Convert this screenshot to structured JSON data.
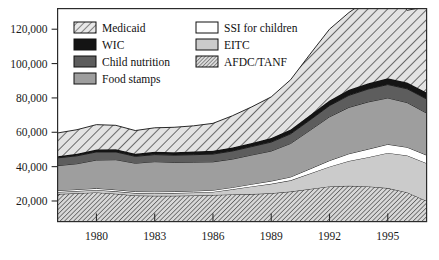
{
  "chart_data": {
    "type": "area",
    "title": "",
    "subtitle": "",
    "xlabel": "",
    "ylabel": "",
    "stacked": true,
    "grid": false,
    "legend_position": "top-left-inside",
    "x": [
      1978,
      1979,
      1980,
      1981,
      1982,
      1983,
      1984,
      1985,
      1986,
      1987,
      1988,
      1989,
      1990,
      1991,
      1992,
      1993,
      1994,
      1995,
      1996,
      1997
    ],
    "xlim": [
      1978,
      1997
    ],
    "ylim": [
      8000,
      132000
    ],
    "xticks": [
      1980,
      1983,
      1986,
      1989,
      1992,
      1995
    ],
    "xtick_labels": [
      "1980",
      "1983",
      "1986",
      "1989",
      "1992",
      "1995"
    ],
    "yticks": [
      20000,
      40000,
      60000,
      80000,
      100000,
      120000
    ],
    "ytick_labels": [
      "20,000",
      "40,000",
      "60,000",
      "80,000",
      "100,000",
      "120,000"
    ],
    "series": [
      {
        "name": "AFDC/TANF",
        "fill": "hatch-dense",
        "color": "#b7b7b7",
        "values": [
          24000,
          24500,
          25000,
          24200,
          23200,
          23000,
          23000,
          23200,
          23500,
          23800,
          24000,
          24500,
          25500,
          27000,
          28500,
          28800,
          28500,
          27500,
          25000,
          20000
        ]
      },
      {
        "name": "EITC",
        "fill": "solid",
        "color": "#cbcbcb",
        "values": [
          1200,
          1300,
          1400,
          1400,
          1400,
          1500,
          1600,
          1700,
          1800,
          3000,
          4500,
          5500,
          6500,
          9000,
          11500,
          14500,
          17000,
          20500,
          21500,
          22000
        ]
      },
      {
        "name": "SSI for children",
        "fill": "solid",
        "color": "#ffffff",
        "values": [
          900,
          900,
          950,
          950,
          900,
          900,
          900,
          950,
          1000,
          1100,
          1300,
          1600,
          2000,
          2700,
          3500,
          4200,
          4700,
          5000,
          4800,
          4700
        ]
      },
      {
        "name": "Food stamps",
        "fill": "solid",
        "color": "#9e9e9e",
        "values": [
          14500,
          15000,
          16500,
          17500,
          16500,
          17500,
          17000,
          16800,
          16500,
          16500,
          17000,
          17500,
          19500,
          22500,
          25500,
          27000,
          27500,
          27000,
          26000,
          24500
        ]
      },
      {
        "name": "Child nutrition",
        "fill": "solid",
        "color": "#5d5d5d",
        "values": [
          4500,
          4600,
          4700,
          4500,
          4000,
          4100,
          4200,
          4300,
          4500,
          4700,
          4900,
          5200,
          5600,
          6000,
          6500,
          7000,
          7500,
          7800,
          8000,
          8200
        ]
      },
      {
        "name": "WIC",
        "fill": "solid",
        "color": "#141414",
        "values": [
          1000,
          1200,
          1400,
          1500,
          1500,
          1600,
          1700,
          1800,
          1900,
          2000,
          2100,
          2300,
          2500,
          2800,
          3000,
          3200,
          3400,
          3600,
          3700,
          3800
        ]
      },
      {
        "name": "Medicaid",
        "fill": "hatch-wide",
        "color": "#d5d5d5",
        "values": [
          13500,
          14000,
          14500,
          14000,
          13500,
          14000,
          14500,
          15000,
          16000,
          18500,
          21000,
          24000,
          29000,
          35500,
          41500,
          45000,
          49000,
          51000,
          42000,
          50000
        ]
      }
    ]
  },
  "legend": {
    "items": [
      {
        "label": "Medicaid",
        "swatch": "hatch-wide"
      },
      {
        "label": "SSI for children",
        "swatch": "white"
      },
      {
        "label": "WIC",
        "swatch": "black"
      },
      {
        "label": "EITC",
        "swatch": "light-gray"
      },
      {
        "label": "Child nutrition",
        "swatch": "dark-gray"
      },
      {
        "label": "AFDC/TANF",
        "swatch": "hatch-dense"
      },
      {
        "label": "Food stamps",
        "swatch": "mid-gray"
      }
    ]
  },
  "colors": {
    "frame": "#2b2b2b",
    "text": "#101010",
    "background": "#ffffff"
  }
}
